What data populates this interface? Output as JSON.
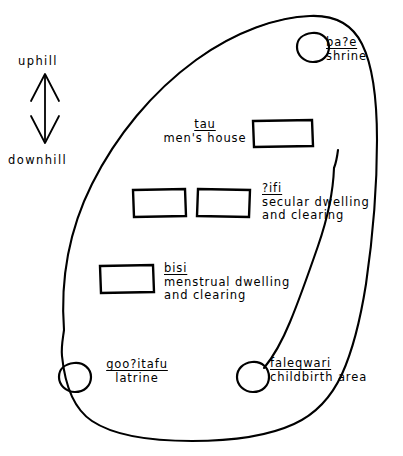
{
  "diagram": {
    "type": "hand-drawn village plan map",
    "stroke_color": "#000000",
    "background_color": "#ffffff"
  },
  "legend": {
    "uphill": "uphill",
    "downhill": "downhill",
    "arrow": "double-headed vertical arrow"
  },
  "features": [
    {
      "id": "bae",
      "term": "ba?e",
      "gloss": "shrine",
      "marker": "circle"
    },
    {
      "id": "tau",
      "term": "tau",
      "gloss": "men's house",
      "marker": "rectangle"
    },
    {
      "id": "ifi",
      "term": "?ifi",
      "gloss_line1": "secular dwelling",
      "gloss_line2": "and clearing",
      "marker": "rectangle"
    },
    {
      "id": "bisi",
      "term": "bisi",
      "gloss_line1": "menstrual dwelling",
      "gloss_line2": "and clearing",
      "marker": "rectangle"
    },
    {
      "id": "gooitafu",
      "term": "goo?itafu",
      "gloss": "latrine",
      "marker": "circle"
    },
    {
      "id": "faleqwari",
      "term": "faleqwari",
      "gloss": "childbirth area",
      "marker": "circle"
    }
  ]
}
